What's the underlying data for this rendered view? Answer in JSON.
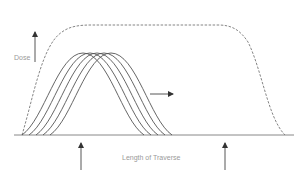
{
  "diagram": {
    "y_axis_label": "Dose",
    "x_axis_label": "Length of Traverse",
    "colors": {
      "line": "#555555",
      "dashed": "#777777",
      "text": "#9a9a9a",
      "background": "#ffffff"
    },
    "envelope": {
      "style": "dashed",
      "description": "cumulative dose envelope: steep rise, flat plateau, steep fall"
    },
    "curves": {
      "count": 5,
      "style": "solid",
      "description": "overlapping bell-shaped dose profiles shifted successively to the right"
    },
    "direction_arrow": "right",
    "markers": [
      {
        "position": "left",
        "direction": "up"
      },
      {
        "position": "right",
        "direction": "up"
      }
    ]
  }
}
